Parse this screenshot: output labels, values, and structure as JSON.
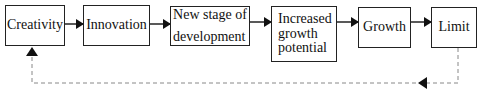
{
  "diagram": {
    "nodes": [
      {
        "id": "creativity",
        "label": "Creativity"
      },
      {
        "id": "innovation",
        "label": "Innovation"
      },
      {
        "id": "new-stage",
        "label": "New stage of\ndevelopment"
      },
      {
        "id": "increased-growth",
        "label": "Increased\ngrowth\npotential"
      },
      {
        "id": "growth",
        "label": "Growth"
      },
      {
        "id": "limit",
        "label": "Limit"
      }
    ],
    "edges": [
      {
        "from": "creativity",
        "to": "innovation",
        "style": "solid"
      },
      {
        "from": "innovation",
        "to": "new-stage",
        "style": "solid"
      },
      {
        "from": "new-stage",
        "to": "increased-growth",
        "style": "solid"
      },
      {
        "from": "increased-growth",
        "to": "growth",
        "style": "solid"
      },
      {
        "from": "growth",
        "to": "limit",
        "style": "solid"
      },
      {
        "from": "limit",
        "to": "creativity",
        "style": "dashed",
        "note": "feedback loop"
      }
    ],
    "colors": {
      "line": "#222222",
      "dashed": "#888888",
      "background": "#ffffff"
    }
  }
}
